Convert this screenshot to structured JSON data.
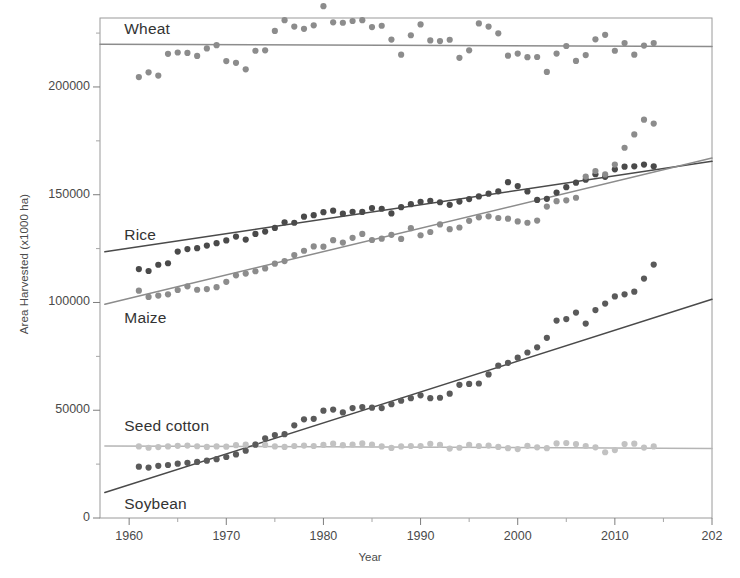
{
  "chart_data": {
    "type": "scatter",
    "title": "",
    "xlabel": "Year",
    "ylabel": "Area Harvested (x1000 ha)",
    "xlim": [
      1957,
      2020
    ],
    "ylim": [
      0,
      232000
    ],
    "xticks": [
      "1960",
      "1970",
      "1980",
      "1990",
      "2000",
      "2010",
      "202"
    ],
    "xtick_values": [
      1960,
      1970,
      1980,
      1990,
      2000,
      2010,
      2020
    ],
    "yticks": [
      "0",
      "50000",
      "100000",
      "150000",
      "200000"
    ],
    "ytick_values": [
      0,
      50000,
      100000,
      150000,
      200000
    ],
    "yminor_values": [
      25000,
      75000,
      125000,
      175000,
      225000
    ],
    "grid": false,
    "legend_position": "inline-annotations",
    "annotations": [
      {
        "text": "Wheat",
        "x": 1959.5,
        "y": 226500
      },
      {
        "text": "Rice",
        "x": 1959.5,
        "y": 131000
      },
      {
        "text": "Maize",
        "x": 1959.5,
        "y": 92500
      },
      {
        "text": "Seed cotton",
        "x": 1959.5,
        "y": 42000
      },
      {
        "text": "Soybean",
        "x": 1959.5,
        "y": 6000
      }
    ],
    "series": [
      {
        "name": "Wheat",
        "color": "#8c8c8c",
        "trend_color": "#8c8c8c",
        "trend": {
          "x1": 1957,
          "y1": 219800,
          "x2": 2020,
          "y2": 218800
        },
        "x": [
          1961,
          1962,
          1963,
          1964,
          1965,
          1966,
          1967,
          1968,
          1969,
          1970,
          1971,
          1972,
          1973,
          1974,
          1975,
          1976,
          1977,
          1978,
          1979,
          1980,
          1981,
          1982,
          1983,
          1984,
          1985,
          1986,
          1987,
          1988,
          1989,
          1990,
          1991,
          1992,
          1993,
          1994,
          1995,
          1996,
          1997,
          1998,
          1999,
          2000,
          2001,
          2002,
          2003,
          2004,
          2005,
          2006,
          2007,
          2008,
          2009,
          2010,
          2011,
          2012,
          2013,
          2014
        ],
        "y": [
          204600,
          206800,
          205300,
          215400,
          216000,
          215800,
          214400,
          217900,
          219400,
          212000,
          211200,
          208200,
          216800,
          217000,
          226000,
          231000,
          228000,
          227000,
          228600,
          237500,
          230000,
          229800,
          230600,
          231000,
          227800,
          228400,
          222000,
          215000,
          224000,
          229000,
          221600,
          221300,
          221900,
          213500,
          217000,
          229500,
          228000,
          224900,
          214500,
          215500,
          213800,
          213900,
          207000,
          215500,
          219000,
          212100,
          214800,
          222100,
          224200,
          216800,
          220400,
          215000,
          219200,
          220400
        ]
      },
      {
        "name": "Rice",
        "color": "#4a4a4a",
        "trend_color": "#4a4a4a",
        "trend": {
          "x1": 1957.5,
          "y1": 123500,
          "x2": 2020,
          "y2": 165500
        },
        "x": [
          1961,
          1962,
          1963,
          1964,
          1965,
          1966,
          1967,
          1968,
          1969,
          1970,
          1971,
          1972,
          1973,
          1974,
          1975,
          1976,
          1977,
          1978,
          1979,
          1980,
          1981,
          1982,
          1983,
          1984,
          1985,
          1986,
          1987,
          1988,
          1989,
          1990,
          1991,
          1992,
          1993,
          1994,
          1995,
          1996,
          1997,
          1998,
          1999,
          2000,
          2001,
          2002,
          2003,
          2004,
          2005,
          2006,
          2007,
          2008,
          2009,
          2010,
          2011,
          2012,
          2013,
          2014
        ],
        "y": [
          115500,
          114600,
          117500,
          118200,
          123600,
          124800,
          125200,
          126400,
          127500,
          128800,
          130600,
          129200,
          131800,
          132900,
          134600,
          137200,
          137000,
          139800,
          140500,
          141900,
          142600,
          141200,
          142100,
          142000,
          143800,
          143500,
          141300,
          144200,
          145600,
          146700,
          147200,
          146500,
          145300,
          146800,
          148000,
          149200,
          150500,
          151600,
          155800,
          154000,
          151500,
          147600,
          148100,
          151000,
          153500,
          155600,
          157000,
          159500,
          158300,
          161800,
          163000,
          163200,
          164000,
          163200
        ]
      },
      {
        "name": "Maize",
        "color": "#8c8c8c",
        "trend_color": "#8c8c8c",
        "trend": {
          "x1": 1957.5,
          "y1": 99200,
          "x2": 2020,
          "y2": 167000
        },
        "x": [
          1961,
          1962,
          1963,
          1964,
          1965,
          1966,
          1967,
          1968,
          1969,
          1970,
          1971,
          1972,
          1973,
          1974,
          1975,
          1976,
          1977,
          1978,
          1979,
          1980,
          1981,
          1982,
          1983,
          1984,
          1985,
          1986,
          1987,
          1988,
          1989,
          1990,
          1991,
          1992,
          1993,
          1994,
          1995,
          1996,
          1997,
          1998,
          1999,
          2000,
          2001,
          2002,
          2003,
          2004,
          2005,
          2006,
          2007,
          2008,
          2009,
          2010,
          2011,
          2012,
          2013,
          2014
        ],
        "y": [
          105500,
          102600,
          103200,
          103800,
          105800,
          107500,
          105900,
          106200,
          107100,
          109600,
          112600,
          113400,
          114500,
          115800,
          118000,
          119200,
          122000,
          124000,
          126000,
          125900,
          128900,
          127800,
          130000,
          131800,
          129000,
          129600,
          131400,
          129500,
          134500,
          131200,
          132700,
          136200,
          134000,
          134800,
          137900,
          139500,
          140000,
          139200,
          138900,
          137600,
          137000,
          138000,
          144500,
          147000,
          147400,
          148600,
          158400,
          161000,
          159400,
          164000,
          171800,
          178000,
          184800,
          183000
        ]
      },
      {
        "name": "Seed cotton",
        "color": "#c2c2c2",
        "trend_color": "#b5b5b5",
        "trend": {
          "x1": 1957.5,
          "y1": 33400,
          "x2": 2020,
          "y2": 32300
        },
        "x": [
          1961,
          1962,
          1963,
          1964,
          1965,
          1966,
          1967,
          1968,
          1969,
          1970,
          1971,
          1972,
          1973,
          1974,
          1975,
          1976,
          1977,
          1978,
          1979,
          1980,
          1981,
          1982,
          1983,
          1984,
          1985,
          1986,
          1987,
          1988,
          1989,
          1990,
          1991,
          1992,
          1993,
          1994,
          1995,
          1996,
          1997,
          1998,
          1999,
          2000,
          2001,
          2002,
          2003,
          2004,
          2005,
          2006,
          2007,
          2008,
          2009,
          2010,
          2011,
          2012,
          2013,
          2014
        ],
        "y": [
          33200,
          32600,
          32900,
          33200,
          33500,
          33600,
          33300,
          33000,
          33200,
          33100,
          33800,
          34000,
          34200,
          33900,
          33200,
          33000,
          33400,
          33600,
          33400,
          33900,
          34500,
          33800,
          34100,
          34600,
          34000,
          33200,
          32500,
          33200,
          33400,
          33400,
          34400,
          33900,
          32200,
          32600,
          33900,
          33400,
          33600,
          33000,
          32400,
          32000,
          33500,
          32800,
          32400,
          34600,
          34800,
          34300,
          33400,
          32800,
          30500,
          31500,
          34300,
          34500,
          32700,
          33200
        ]
      },
      {
        "name": "Soybean",
        "color": "#5a5a5a",
        "trend_color": "#4a4a4a",
        "trend": {
          "x1": 1957.5,
          "y1": 11800,
          "x2": 2020,
          "y2": 101500
        },
        "x": [
          1961,
          1962,
          1963,
          1964,
          1965,
          1966,
          1967,
          1968,
          1969,
          1970,
          1971,
          1972,
          1973,
          1974,
          1975,
          1976,
          1977,
          1978,
          1979,
          1980,
          1981,
          1982,
          1983,
          1984,
          1985,
          1986,
          1987,
          1988,
          1989,
          1990,
          1991,
          1992,
          1993,
          1994,
          1995,
          1996,
          1997,
          1998,
          1999,
          2000,
          2001,
          2002,
          2003,
          2004,
          2005,
          2006,
          2007,
          2008,
          2009,
          2010,
          2011,
          2012,
          2013,
          2014
        ],
        "y": [
          23800,
          23400,
          24200,
          24600,
          25200,
          25600,
          26000,
          26600,
          27300,
          28300,
          29500,
          31200,
          34000,
          37000,
          38500,
          38900,
          43000,
          45800,
          46000,
          49800,
          50300,
          49000,
          51000,
          51500,
          51200,
          51000,
          52800,
          54400,
          55600,
          56900,
          55600,
          55800,
          57700,
          61800,
          62200,
          62400,
          66600,
          70700,
          72000,
          74400,
          76800,
          79200,
          83600,
          91600,
          92300,
          95300,
          90200,
          96500,
          99500,
          102800,
          103800,
          105000,
          111100,
          117600
        ]
      }
    ]
  }
}
